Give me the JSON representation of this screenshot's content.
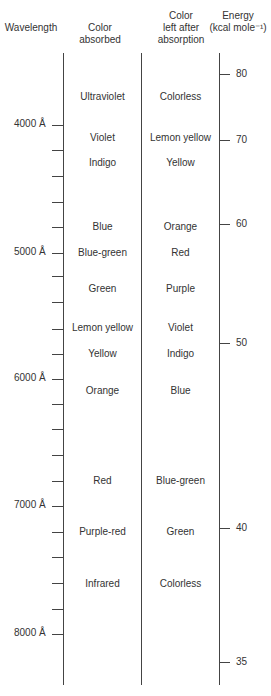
{
  "headers": {
    "wavelength": "Wavelength",
    "absorbed": "Color\nabsorbed",
    "absorbed_l1": "Color",
    "absorbed_l2": "absorbed",
    "left_l1": "Color",
    "left_l2": "left after",
    "left_l3": "absorption",
    "energy_l1": "Energy",
    "energy_l2": "(kcal mole⁻¹)"
  },
  "wavelength_axis": {
    "labels": [
      "4000 Å",
      "5000 Å",
      "6000 Å",
      "7000 Å",
      "8000 Å"
    ],
    "label_y": [
      125,
      253,
      379,
      506,
      634
    ],
    "tick_y": [
      125,
      150,
      176,
      202,
      227,
      253,
      276,
      302,
      329,
      354,
      379,
      404,
      429,
      455,
      481,
      506,
      532,
      557,
      583,
      609,
      634
    ]
  },
  "energy_axis": {
    "labels": [
      "80",
      "70",
      "60",
      "50",
      "40",
      "35"
    ],
    "tick_y": [
      74,
      140,
      224,
      343,
      528,
      662
    ]
  },
  "rows": [
    {
      "absorbed": "Ultraviolet",
      "left": "Colorless",
      "y": 97
    },
    {
      "absorbed": "Violet",
      "left": "Lemon yellow",
      "y": 138
    },
    {
      "absorbed": "Indigo",
      "left": "Yellow",
      "y": 163
    },
    {
      "absorbed": "Blue",
      "left": "Orange",
      "y": 227
    },
    {
      "absorbed": "Blue-green",
      "left": "Red",
      "y": 253
    },
    {
      "absorbed": "Green",
      "left": "Purple",
      "y": 289
    },
    {
      "absorbed": "Lemon yellow",
      "left": "Violet",
      "y": 328
    },
    {
      "absorbed": "Yellow",
      "left": "Indigo",
      "y": 354
    },
    {
      "absorbed": "Orange",
      "left": "Blue",
      "y": 391
    },
    {
      "absorbed": "Red",
      "left": "Blue-green",
      "y": 481
    },
    {
      "absorbed": "Purple-red",
      "left": "Green",
      "y": 532
    },
    {
      "absorbed": "Infrared",
      "left": "Colorless",
      "y": 584
    }
  ]
}
